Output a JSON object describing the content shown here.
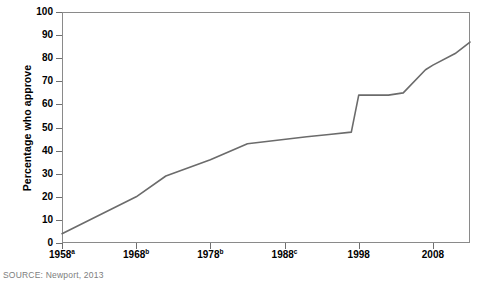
{
  "chart_data": {
    "type": "line",
    "title": "",
    "subtitle": "",
    "xlabel": "",
    "ylabel": "Percentage who approve",
    "xlim": [
      1958,
      2013
    ],
    "ylim": [
      0,
      100
    ],
    "grid": false,
    "legend": null,
    "x_tick_labels": [
      "1958",
      "1968",
      "1978",
      "1988",
      "1998",
      "2008"
    ],
    "x_tick_superscripts": [
      "a",
      "b",
      "b",
      "c",
      "",
      ""
    ],
    "x_tick_values": [
      1958,
      1968,
      1978,
      1988,
      1998,
      2008
    ],
    "y_tick_labels": [
      "0",
      "10",
      "20",
      "30",
      "40",
      "50",
      "60",
      "70",
      "80",
      "90",
      "100"
    ],
    "y_tick_values": [
      0,
      10,
      20,
      30,
      40,
      50,
      60,
      70,
      80,
      90,
      100
    ],
    "series": [
      {
        "name": "Percentage who approve",
        "color": "#6b6b6b",
        "x": [
          1958,
          1968,
          1972,
          1978,
          1983,
          1991,
          1994,
          1997,
          1998,
          2002,
          2004,
          2007,
          2008,
          2011,
          2013
        ],
        "values": [
          4,
          20,
          29,
          36,
          43,
          46,
          47,
          48,
          64,
          64,
          65,
          75,
          77,
          82,
          87
        ]
      }
    ],
    "annotations": []
  },
  "figure": {
    "y_axis_title": "Percentage who approve",
    "source_note": "SOURCE: Newport, 2013",
    "line_color": "#6b6b6b",
    "frame_color": "#8a8a8a",
    "background": "#ffffff"
  }
}
